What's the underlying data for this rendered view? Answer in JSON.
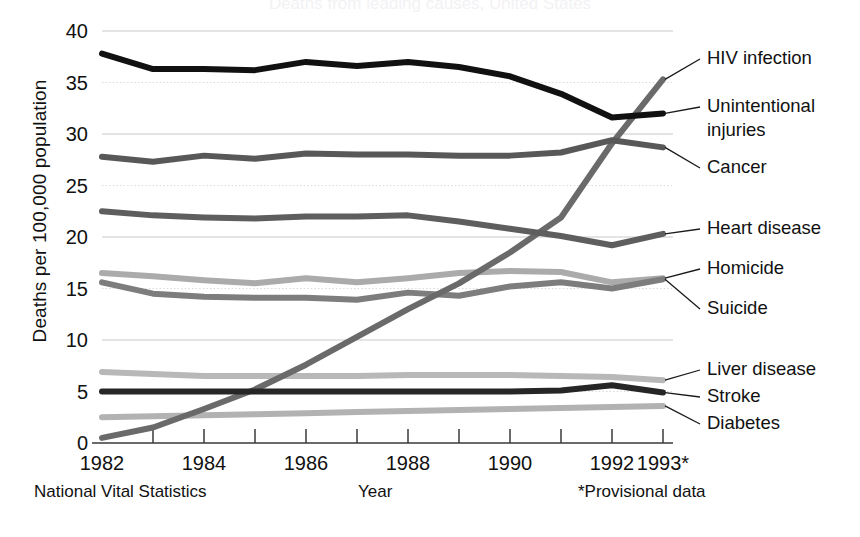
{
  "figure": {
    "ghost_title": "Deaths from leading causes, United States",
    "ylabel": "Deaths per 100,000 population",
    "xlabel": "Year",
    "source_note": "National Vital Statistics",
    "provisional_note": "*Provisional data"
  },
  "chart_data": {
    "type": "line",
    "title": "",
    "xlabel": "Year",
    "ylabel": "Deaths per 100,000 population",
    "xlim": [
      1982,
      1993
    ],
    "ylim": [
      0,
      40
    ],
    "ytick_values": [
      0,
      5,
      10,
      15,
      20,
      25,
      30,
      35,
      40
    ],
    "ytick_labels": [
      "0",
      "5",
      "10",
      "15",
      "20",
      "25",
      "30",
      "35",
      "40"
    ],
    "xtick_values": [
      1982,
      1983,
      1984,
      1985,
      1986,
      1987,
      1988,
      1989,
      1990,
      1991,
      1992,
      1993
    ],
    "xtick_labels": [
      "1982",
      "",
      "1984",
      "",
      "1986",
      "",
      "1988",
      "",
      "1990",
      "",
      "1992",
      "1993*"
    ],
    "grid": "horizontal-dotted",
    "legend_position": "right-annotations",
    "x": [
      1982,
      1983,
      1984,
      1985,
      1986,
      1987,
      1988,
      1989,
      1990,
      1991,
      1992,
      1993
    ],
    "series": [
      {
        "name": "Unintentional injuries",
        "color": "#111111",
        "width": 6,
        "values": [
          37.8,
          36.3,
          36.3,
          36.2,
          37.0,
          36.6,
          37.0,
          36.5,
          35.6,
          33.9,
          31.6,
          32.0
        ],
        "label_x": 707,
        "label_y": 107,
        "label_lines": [
          "Unintentional",
          "injuries"
        ]
      },
      {
        "name": "HIV infection",
        "color": "#6a6a6a",
        "width": 6,
        "values": [
          0.5,
          1.5,
          3.3,
          5.2,
          7.6,
          10.3,
          13.0,
          15.5,
          18.5,
          21.9,
          29.1,
          35.3
        ],
        "label_x": 707,
        "label_y": 59,
        "label_lines": [
          "HIV infection"
        ]
      },
      {
        "name": "Cancer",
        "color": "#585858",
        "width": 6,
        "values": [
          27.8,
          27.3,
          27.9,
          27.6,
          28.1,
          28.0,
          28.0,
          27.9,
          27.9,
          28.2,
          29.4,
          28.7
        ],
        "label_x": 707,
        "label_y": 168,
        "label_lines": [
          "Cancer"
        ]
      },
      {
        "name": "Heart disease",
        "color": "#5e5e5e",
        "width": 6,
        "values": [
          22.5,
          22.1,
          21.9,
          21.8,
          22.0,
          22.0,
          22.1,
          21.5,
          20.8,
          20.1,
          19.2,
          20.3
        ],
        "label_x": 707,
        "label_y": 229,
        "label_lines": [
          "Heart disease"
        ]
      },
      {
        "name": "Homicide",
        "color": "#ababab",
        "width": 6,
        "values": [
          16.5,
          16.2,
          15.8,
          15.5,
          16.0,
          15.6,
          16.0,
          16.5,
          16.7,
          16.6,
          15.6,
          16.0
        ],
        "label_x": 707,
        "label_y": 269,
        "label_lines": [
          "Homicide"
        ]
      },
      {
        "name": "Suicide",
        "color": "#7d7d7d",
        "width": 6,
        "values": [
          15.6,
          14.5,
          14.2,
          14.1,
          14.1,
          13.9,
          14.6,
          14.3,
          15.2,
          15.6,
          15.0,
          15.9
        ],
        "label_x": 707,
        "label_y": 309,
        "label_lines": [
          "Suicide"
        ]
      },
      {
        "name": "Liver disease",
        "color": "#b8b8b8",
        "width": 6,
        "values": [
          6.9,
          6.7,
          6.5,
          6.5,
          6.5,
          6.5,
          6.6,
          6.6,
          6.6,
          6.5,
          6.4,
          6.1
        ],
        "label_x": 707,
        "label_y": 370,
        "label_lines": [
          "Liver disease"
        ]
      },
      {
        "name": "Stroke",
        "color": "#262626",
        "width": 6,
        "values": [
          5.0,
          5.0,
          5.0,
          5.0,
          5.0,
          5.0,
          5.0,
          5.0,
          5.0,
          5.1,
          5.6,
          4.9
        ],
        "label_x": 707,
        "label_y": 397,
        "label_lines": [
          "Stroke"
        ]
      },
      {
        "name": "Diabetes",
        "color": "#b2b2b2",
        "width": 6,
        "values": [
          2.5,
          2.6,
          2.7,
          2.8,
          2.9,
          3.0,
          3.1,
          3.2,
          3.3,
          3.4,
          3.5,
          3.6
        ],
        "label_x": 707,
        "label_y": 424,
        "label_lines": [
          "Diabetes"
        ]
      }
    ]
  }
}
